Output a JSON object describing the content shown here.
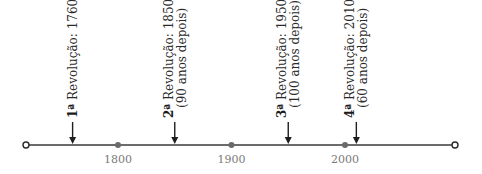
{
  "timeline": {
    "x_range": [
      1700,
      2100
    ],
    "ticks": [
      {
        "year": 1800,
        "label": "1800"
      },
      {
        "year": 1900,
        "label": "1900"
      },
      {
        "year": 2000,
        "label": "2000"
      }
    ],
    "events": [
      {
        "year": 1760,
        "ordinal": "1ª",
        "title": " Revolução: 1760",
        "note": ""
      },
      {
        "year": 1850,
        "ordinal": "2ª",
        "title": " Revolução: 1850",
        "note": "(90 anos depois)"
      },
      {
        "year": 1950,
        "ordinal": "3ª",
        "title": " Revolução:  1950",
        "note": "(100 anos depois)"
      },
      {
        "year": 2010,
        "ordinal": "4ª",
        "title": " Revolução: 2010",
        "note": "(60 anos depois)"
      }
    ]
  }
}
